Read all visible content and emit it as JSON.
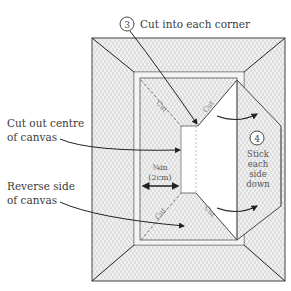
{
  "diagram": {
    "steps": [
      {
        "number": "3",
        "label": "Cut into each corner"
      },
      {
        "number": "4",
        "label_lines": [
          "Stick",
          "each",
          "side",
          "down"
        ]
      }
    ],
    "callouts": {
      "cutout": [
        "Cut out centre",
        "of canvas"
      ],
      "reverse": [
        "Reverse side",
        "of canvas"
      ]
    },
    "cut_labels": [
      "Cut",
      "Cut",
      "Cut",
      "Cut"
    ],
    "measurement": {
      "imperial": "¾in",
      "metric": "(2cm)"
    },
    "colors": {
      "line": "#222222",
      "frame_fill": "#ececec",
      "hatch": "#c8c8c8",
      "cutout_fill": "#ffffff"
    }
  }
}
